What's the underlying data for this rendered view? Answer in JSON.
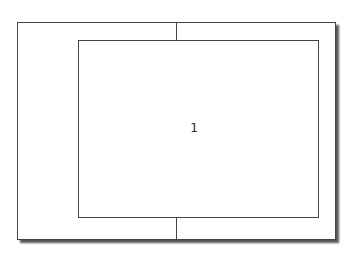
{
  "diagram": {
    "inner_label": "1",
    "colors": {
      "stroke": "#444444",
      "shadow": "#555555",
      "background": "#ffffff"
    }
  }
}
